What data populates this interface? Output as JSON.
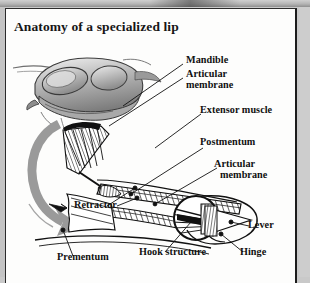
{
  "figure": {
    "title": "Anatomy of a specialized lip",
    "frame_color": "#1c1c1c",
    "ink_color": "#101010",
    "arrow_color": "#999999"
  },
  "labels": [
    {
      "id": "mandible",
      "text": "Mandible",
      "x": 186,
      "y": 60
    },
    {
      "id": "articular-membrane-1",
      "text": "Articular",
      "x": 186,
      "y": 72
    },
    {
      "id": "articular-membrane-1b",
      "text": "membrane",
      "x": 186,
      "y": 83
    },
    {
      "id": "extensor-muscle",
      "text": "Extensor muscle",
      "x": 204,
      "y": 110
    },
    {
      "id": "postmentum",
      "text": "Postmentum",
      "x": 202,
      "y": 138
    },
    {
      "id": "articular-membrane-2",
      "text": "Articular",
      "x": 216,
      "y": 162
    },
    {
      "id": "articular-membrane-2b",
      "text": "membrane",
      "x": 222,
      "y": 173
    },
    {
      "id": "lever",
      "text": "Lever",
      "x": 248,
      "y": 218
    },
    {
      "id": "retractor",
      "text": "Retractor",
      "x": 76,
      "y": 200
    },
    {
      "id": "hook-structure",
      "text": "Hook structure",
      "x": 140,
      "y": 247
    },
    {
      "id": "hinge",
      "text": "Hinge",
      "x": 240,
      "y": 247
    },
    {
      "id": "prementum",
      "text": "Prementum",
      "x": 58,
      "y": 252
    }
  ],
  "parts": {
    "head_drawing": "shaded-nymph-head-profile",
    "motion_arrow": "curved-gray-strike-arrow",
    "inset": "magnified-circle-hook-hinge"
  }
}
